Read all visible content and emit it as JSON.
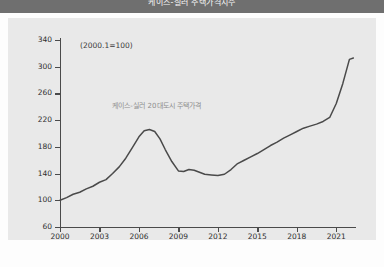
{
  "header": {
    "title": "케이스-실러 주택가격지수"
  },
  "chart_data": {
    "type": "line",
    "title": "",
    "subtitle": "",
    "base_note": "(2000.1=100)",
    "series_annotation": "케이스-실러 20대도시 주택가격",
    "xlabel": "",
    "ylabel": "",
    "ylim": [
      60,
      340
    ],
    "yticks": [
      60,
      100,
      140,
      180,
      220,
      260,
      300,
      340
    ],
    "ytick_labels": [
      "60",
      "100",
      "140",
      "180",
      "220",
      "260",
      "300",
      "340"
    ],
    "xlim": [
      2000,
      2022.5
    ],
    "xticks": [
      2000,
      2003,
      2006,
      2009,
      2012,
      2015,
      2018,
      2021
    ],
    "xtick_labels": [
      "2000",
      "2003",
      "2006",
      "2009",
      "2012",
      "2015",
      "2018",
      "2021"
    ],
    "grid": false,
    "legend": "none",
    "line_color": "#4a4a4a",
    "series": [
      {
        "name": "케이스-실러 20대도시 주택가격",
        "x": [
          2000.0,
          2000.5,
          2001.0,
          2001.5,
          2002.0,
          2002.5,
          2003.0,
          2003.5,
          2004.0,
          2004.5,
          2005.0,
          2005.5,
          2006.0,
          2006.4,
          2006.8,
          2007.2,
          2007.6,
          2008.0,
          2008.5,
          2009.0,
          2009.4,
          2009.8,
          2010.2,
          2010.6,
          2011.0,
          2011.5,
          2012.0,
          2012.5,
          2013.0,
          2013.5,
          2014.0,
          2014.5,
          2015.0,
          2015.5,
          2016.0,
          2016.5,
          2017.0,
          2017.5,
          2018.0,
          2018.5,
          2019.0,
          2019.5,
          2020.0,
          2020.5,
          2021.0,
          2021.5,
          2022.0,
          2022.3
        ],
        "values": [
          100,
          104,
          109,
          112,
          117,
          121,
          127,
          131,
          140,
          150,
          163,
          179,
          195,
          204,
          206,
          203,
          192,
          176,
          158,
          144,
          143,
          146,
          145,
          142,
          139,
          138,
          137,
          139,
          146,
          155,
          160,
          165,
          170,
          176,
          182,
          187,
          193,
          198,
          203,
          208,
          211,
          214,
          218,
          224,
          245,
          275,
          311,
          313
        ]
      }
    ]
  }
}
